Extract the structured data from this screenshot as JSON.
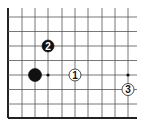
{
  "diagram": {
    "type": "go-board-partial",
    "grid": {
      "x_lines": [
        8,
        22,
        35,
        48,
        62,
        75,
        88,
        102,
        115,
        128
      ],
      "y_lines": [
        17,
        31.5,
        46,
        60.5,
        75,
        89.5,
        104,
        118
      ],
      "right_extent": 137,
      "top_extent": 8,
      "edges": [
        "left",
        "bottom"
      ],
      "line_color": "#555555",
      "edge_color": "#222222"
    },
    "star_points": [
      {
        "x": 48,
        "y": 75
      },
      {
        "x": 128,
        "y": 75
      }
    ],
    "stones": [
      {
        "color": "black",
        "x": 35,
        "y": 75,
        "label": "",
        "r": 6.5
      },
      {
        "color": "white",
        "x": 75,
        "y": 75,
        "label": "1",
        "r": 6
      },
      {
        "color": "black",
        "x": 48,
        "y": 46,
        "label": "2",
        "r": 6
      },
      {
        "color": "white",
        "x": 128,
        "y": 89.5,
        "label": "3",
        "r": 6
      }
    ]
  }
}
